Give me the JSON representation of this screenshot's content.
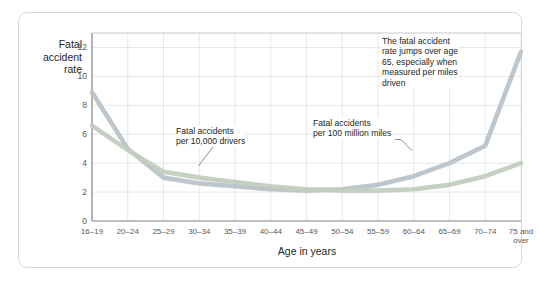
{
  "figure": {
    "frame_color": "#d8d8d8",
    "background": "#ffffff"
  },
  "chart_data": {
    "type": "line",
    "title": "",
    "xlabel": "Age in years",
    "ylabel": "Fatal accident rate",
    "ylabel_lines": [
      "Fatal",
      "accident",
      "rate"
    ],
    "categories": [
      "16–19",
      "20–24",
      "25–29",
      "30–34",
      "35–39",
      "40–44",
      "45–49",
      "50–54",
      "55–59",
      "60–64",
      "65–69",
      "70–74",
      "75 and over"
    ],
    "category_lines": [
      [
        "16–19"
      ],
      [
        "20–24"
      ],
      [
        "25–29"
      ],
      [
        "30–34"
      ],
      [
        "35–39"
      ],
      [
        "40–44"
      ],
      [
        "45–49"
      ],
      [
        "50–54"
      ],
      [
        "55–59"
      ],
      [
        "60–64"
      ],
      [
        "65–69"
      ],
      [
        "70–74"
      ],
      [
        "75 and",
        "over"
      ]
    ],
    "yticks": [
      0,
      2,
      4,
      6,
      8,
      10,
      12
    ],
    "ylim": [
      0,
      13
    ],
    "grid": true,
    "legend_position": "inline-annotations",
    "series": [
      {
        "name": "Fatal accidents per 100 million miles",
        "color": "#b9c2ca",
        "values": [
          8.9,
          5.0,
          3.0,
          2.6,
          2.4,
          2.2,
          2.1,
          2.2,
          2.5,
          3.1,
          4.0,
          5.2,
          11.7
        ]
      },
      {
        "name": "Fatal accidents per 10,000 drivers",
        "color": "#c3cdbe",
        "values": [
          6.6,
          4.9,
          3.4,
          3.0,
          2.7,
          2.4,
          2.2,
          2.1,
          2.1,
          2.2,
          2.5,
          3.1,
          4.0
        ]
      }
    ],
    "annotations": [
      {
        "id": "annot-drivers",
        "lines": [
          "Fatal accidents",
          "per 10,000 drivers"
        ]
      },
      {
        "id": "annot-miles",
        "lines": [
          "Fatal accidents",
          "per 100 million miles"
        ]
      },
      {
        "id": "annot-callout",
        "lines": [
          "The fatal accident",
          "rate jumps over age",
          "65, especially when",
          "measured per miles",
          "driven"
        ]
      }
    ]
  }
}
